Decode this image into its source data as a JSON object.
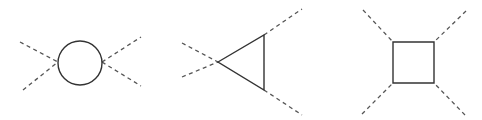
{
  "diagram": {
    "title": "",
    "background": "#ffffff",
    "colors": {
      "loop_stroke": "#333333",
      "external_stroke": "#555555"
    },
    "figures": [
      {
        "name": "bubble",
        "loop": {
          "shape": "circle",
          "cx": 80,
          "cy": 63,
          "r": 22
        },
        "external_lines": [
          {
            "x1": 20,
            "y1": 42,
            "x2": 58,
            "y2": 62
          },
          {
            "x1": 23,
            "y1": 90,
            "x2": 58,
            "y2": 62
          },
          {
            "x1": 102,
            "y1": 62,
            "x2": 141,
            "y2": 37
          },
          {
            "x1": 102,
            "y1": 62,
            "x2": 141,
            "y2": 86
          }
        ]
      },
      {
        "name": "triangle",
        "loop": {
          "shape": "polygon",
          "points": "218,62 264,35 264,90"
        },
        "external_lines": [
          {
            "x1": 182,
            "y1": 43,
            "x2": 218,
            "y2": 62
          },
          {
            "x1": 182,
            "y1": 77,
            "x2": 218,
            "y2": 62
          },
          {
            "x1": 264,
            "y1": 35,
            "x2": 302,
            "y2": 9
          },
          {
            "x1": 264,
            "y1": 90,
            "x2": 302,
            "y2": 115
          }
        ]
      },
      {
        "name": "box",
        "loop": {
          "shape": "polygon",
          "points": "393,42 434,42 434,83 393,83"
        },
        "external_lines": [
          {
            "x1": 363,
            "y1": 10,
            "x2": 393,
            "y2": 42
          },
          {
            "x1": 466,
            "y1": 11,
            "x2": 434,
            "y2": 42
          },
          {
            "x1": 362,
            "y1": 114,
            "x2": 393,
            "y2": 83
          },
          {
            "x1": 465,
            "y1": 115,
            "x2": 434,
            "y2": 83
          }
        ]
      }
    ]
  }
}
